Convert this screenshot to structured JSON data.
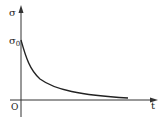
{
  "diagram": {
    "type": "stress-relaxation curve",
    "y_axis_label": "σ",
    "x_axis_label": "t",
    "origin_label": "O",
    "initial_value_label": "σ0",
    "initial_value_label_main": "σ",
    "initial_value_label_sub": "0",
    "curve_description": "decaying curve starting at σ0 on the y-axis, asymptotically approaching the t-axis",
    "colors": {
      "ink": "#222222",
      "background": "#ffffff"
    }
  }
}
